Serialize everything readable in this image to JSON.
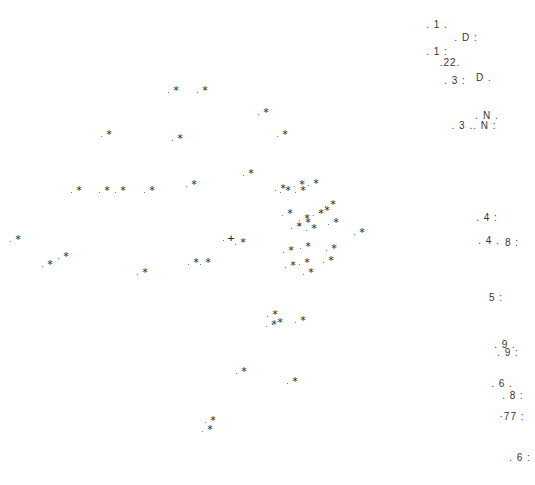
{
  "chart_data": {
    "type": "scatter",
    "title": "",
    "xlabel": "",
    "ylabel": "",
    "grid": false,
    "legend": null,
    "marker_symbol": "*",
    "series": [
      {
        "name": "asterisk-points",
        "points": [
          [
            176,
            90
          ],
          [
            205,
            90
          ],
          [
            266,
            112
          ],
          [
            109,
            134
          ],
          [
            180,
            138
          ],
          [
            285,
            134
          ],
          [
            251,
            173
          ],
          [
            79,
            190
          ],
          [
            107,
            190
          ],
          [
            123,
            190
          ],
          [
            152,
            190
          ],
          [
            194,
            184
          ],
          [
            283,
            188
          ],
          [
            288,
            190
          ],
          [
            302,
            184
          ],
          [
            316,
            183
          ],
          [
            303,
            190
          ],
          [
            327,
            210
          ],
          [
            333,
            204
          ],
          [
            290,
            213
          ],
          [
            321,
            213
          ],
          [
            307,
            218
          ],
          [
            336,
            222
          ],
          [
            308,
            222
          ],
          [
            299,
            226
          ],
          [
            314,
            228
          ],
          [
            362,
            232
          ],
          [
            18,
            239
          ],
          [
            243,
            242
          ],
          [
            66,
            256
          ],
          [
            50,
            264
          ],
          [
            145,
            272
          ],
          [
            196,
            262
          ],
          [
            208,
            262
          ],
          [
            291,
            250
          ],
          [
            308,
            246
          ],
          [
            334,
            248
          ],
          [
            293,
            265
          ],
          [
            307,
            262
          ],
          [
            331,
            260
          ],
          [
            311,
            272
          ],
          [
            275,
            314
          ],
          [
            280,
            322
          ],
          [
            274,
            324
          ],
          [
            303,
            320
          ],
          [
            244,
            371
          ],
          [
            295,
            381
          ],
          [
            213,
            420
          ],
          [
            210,
            429
          ]
        ]
      },
      {
        "name": "plus-points",
        "symbol": "+",
        "points": [
          [
            231,
            238
          ]
        ]
      }
    ],
    "annotations": [
      {
        "text": ". 1 .",
        "x": 437,
        "y": 25
      },
      {
        "text": ". D :",
        "x": 466,
        "y": 38
      },
      {
        "text": ". 1 :",
        "x": 437,
        "y": 52
      },
      {
        "text": ".22.",
        "x": 450,
        "y": 63
      },
      {
        "text": ". 3 :",
        "x": 455,
        "y": 81
      },
      {
        "text": "D .",
        "x": 484,
        "y": 78
      },
      {
        "text": ". N .",
        "x": 487,
        "y": 116
      },
      {
        "text": ". 3 .. N :",
        "x": 474,
        "y": 126
      },
      {
        "text": ". 4 :",
        "x": 487,
        "y": 218
      },
      {
        "text": ". 4 .",
        "x": 489,
        "y": 241
      },
      {
        "text": "8 :",
        "x": 512,
        "y": 243
      },
      {
        "text": "5 :",
        "x": 496,
        "y": 298
      },
      {
        "text": ". 9 .",
        "x": 505,
        "y": 345
      },
      {
        "text": ". 9 :",
        "x": 508,
        "y": 353
      },
      {
        "text": ". 6 .",
        "x": 502,
        "y": 384
      },
      {
        "text": ". 8 :",
        "x": 513,
        "y": 396
      },
      {
        "text": "·77 :",
        "x": 512,
        "y": 417
      },
      {
        "text": ". 6 :",
        "x": 520,
        "y": 458
      }
    ],
    "xlim": [
      0,
      535
    ],
    "ylim": [
      485,
      0
    ]
  }
}
